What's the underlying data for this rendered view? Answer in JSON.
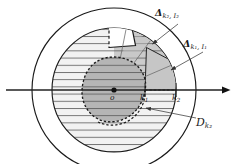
{
  "figure": {
    "background_color": "#ffffff",
    "stroke_color": "#1a1a1a",
    "labels": {
      "delta_k2_I2": {
        "symbol": "Δ",
        "sub": "k₂, I₂"
      },
      "delta_k1_I1": {
        "symbol": "Δ",
        "sub": "k₁, I₁"
      },
      "region_outer": {
        "symbol": "D",
        "sub": "k₂"
      },
      "origin": "o",
      "tick_k1": {
        "symbol": "k",
        "sub": "1"
      },
      "tick_k2": {
        "symbol": "k",
        "sub": "2"
      }
    },
    "colors": {
      "outer_disk_fill": "#ffffff",
      "hatched_disk_fill": "#f0f0f0",
      "sector_fill": "#cccccc",
      "inner_blob_fill": "#b8b8b8",
      "notch_fill": "#ffffff",
      "hatch_line": "#555555",
      "axis": "#222222"
    },
    "geometry": {
      "center_x": 114,
      "center_y": 90,
      "outer_radius": 82,
      "middle_radius": 62,
      "inner_radius": 33,
      "axis_y": 90,
      "axis_start_x": 6,
      "axis_end_x": 232
    }
  }
}
